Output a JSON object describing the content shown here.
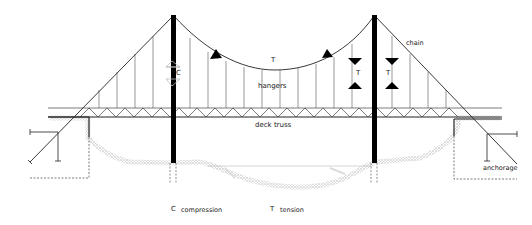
{
  "diagram": {
    "labels": {
      "chain": "chain",
      "hangers": "hangers",
      "deck_truss": "deck truss",
      "anchorage": "anchorage",
      "main_span_force": "T",
      "left_tower_force": "C",
      "right_tower_force_left": "T",
      "right_tower_force_right": "T"
    },
    "legend": [
      {
        "symbol": "C",
        "meaning": "compression"
      },
      {
        "symbol": "T",
        "meaning": "tension"
      }
    ],
    "colors": {
      "line": "#222222",
      "tower": "#000000",
      "ground": "#bdbdbd",
      "compression_arrow": "#c8c8c8",
      "tension_arrow": "#000000"
    }
  }
}
